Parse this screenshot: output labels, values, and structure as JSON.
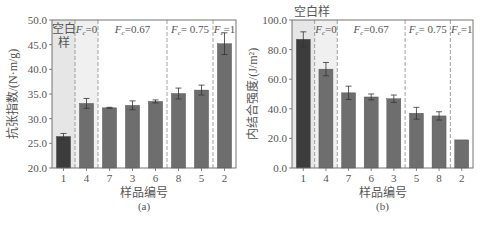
{
  "chart_data": [
    {
      "type": "bar",
      "panel_label": "(a)",
      "title": "",
      "xlabel": "样品编号",
      "ylabel": "抗张指数/(N·m/g)",
      "ylim": [
        20.0,
        50.0
      ],
      "yticks": [
        "20.0",
        "25.0",
        "30.0",
        "35.0",
        "40.0",
        "45.0",
        "50.0"
      ],
      "grid": false,
      "categories": [
        "1",
        "4",
        "7",
        "3",
        "6",
        "8",
        "5",
        "2"
      ],
      "values": [
        26.4,
        33.1,
        32.2,
        32.7,
        33.5,
        35.1,
        35.8,
        45.2
      ],
      "errors": [
        0.6,
        1.0,
        0.1,
        0.9,
        0.3,
        1.1,
        1.0,
        2.2
      ],
      "bar_colors": [
        "#3c3c3c",
        "#6e6e6e",
        "#6e6e6e",
        "#6e6e6e",
        "#6e6e6e",
        "#6e6e6e",
        "#6e6e6e",
        "#6e6e6e"
      ],
      "groups": [
        {
          "label": "空白样",
          "start": 0,
          "end": 0,
          "shaded": true
        },
        {
          "label": "Fc=0",
          "start": 1,
          "end": 1,
          "shaded": true
        },
        {
          "label": "Fc=0.67",
          "start": 2,
          "end": 4,
          "shaded": false
        },
        {
          "label": "Fc= 0.75",
          "start": 5,
          "end": 6,
          "shaded": false
        },
        {
          "label": "Fc=1",
          "start": 7,
          "end": 7,
          "shaded": false
        }
      ]
    },
    {
      "type": "bar",
      "panel_label": "(b)",
      "title": "",
      "xlabel": "样品编号",
      "ylabel": "内结合强度/(J/m²)",
      "ylim": [
        0.0,
        100.0
      ],
      "yticks": [
        "0.0",
        "20.0",
        "40.0",
        "60.0",
        "80.0",
        "100.0"
      ],
      "grid": false,
      "categories": [
        "1",
        "4",
        "7",
        "6",
        "3",
        "5",
        "8",
        "2"
      ],
      "values": [
        87.0,
        66.8,
        50.8,
        48.0,
        46.8,
        37.0,
        35.2,
        19.0
      ],
      "errors": [
        5.0,
        4.5,
        4.5,
        2.0,
        2.5,
        4.0,
        2.8,
        0.0
      ],
      "bar_colors": [
        "#3c3c3c",
        "#6e6e6e",
        "#6e6e6e",
        "#6e6e6e",
        "#6e6e6e",
        "#6e6e6e",
        "#6e6e6e",
        "#6e6e6e"
      ],
      "groups": [
        {
          "label": "空白样",
          "start": 0,
          "end": 0,
          "shaded": true,
          "label_outside": true
        },
        {
          "label": "Fc=0",
          "start": 1,
          "end": 1,
          "shaded": true
        },
        {
          "label": "Fc=0.67",
          "start": 2,
          "end": 4,
          "shaded": false
        },
        {
          "label": "Fc= 0.75",
          "start": 5,
          "end": 6,
          "shaded": false
        },
        {
          "label": "Fc=1",
          "start": 7,
          "end": 7,
          "shaded": false
        }
      ]
    }
  ],
  "colors": {
    "axis": "#666666",
    "text": "#555555",
    "shade_blank": "#e6e6e6",
    "shade_fc0": "#f0f0f0",
    "divider": "#8a8a8a"
  }
}
